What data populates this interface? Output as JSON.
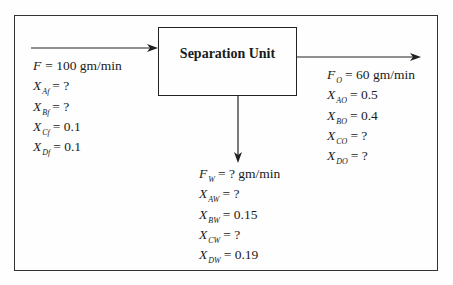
{
  "diagram": {
    "unit_label": "Separation Unit",
    "streams": {
      "feed": {
        "lines": [
          {
            "var": "F",
            "sub": "",
            "value": "= 100 gm/min"
          },
          {
            "var": "X",
            "sub": "Af",
            "value": "= ?"
          },
          {
            "var": "X",
            "sub": "Bf",
            "value": "= ?"
          },
          {
            "var": "X",
            "sub": "Cf",
            "value": "= 0.1"
          },
          {
            "var": "X",
            "sub": "Df",
            "value": "= 0.1"
          }
        ]
      },
      "overhead": {
        "lines": [
          {
            "var": "F",
            "sub": "O",
            "value": "= 60 gm/min"
          },
          {
            "var": "X",
            "sub": "AO",
            "value": "= 0.5"
          },
          {
            "var": "X",
            "sub": "BO",
            "value": "= 0.4"
          },
          {
            "var": "X",
            "sub": "CO",
            "value": "= ?"
          },
          {
            "var": "X",
            "sub": "DO",
            "value": "= ?"
          }
        ]
      },
      "waste": {
        "lines": [
          {
            "var": "F",
            "sub": "W",
            "value": "= ? gm/min"
          },
          {
            "var": "X",
            "sub": "AW",
            "value": "= ?"
          },
          {
            "var": "X",
            "sub": "BW",
            "value": "= 0.15"
          },
          {
            "var": "X",
            "sub": "CW",
            "value": "= ?"
          },
          {
            "var": "X",
            "sub": "DW",
            "value": "= 0.19"
          }
        ]
      }
    },
    "colors": {
      "line": "#222222",
      "background": "#fefefe"
    }
  }
}
